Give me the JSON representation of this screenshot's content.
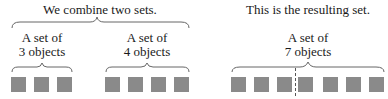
{
  "left_panel": {
    "title": "We combine two sets.",
    "set_a": {
      "line1": "A set of",
      "line2": "3 objects",
      "count": 3
    },
    "set_b": {
      "line1": "A set of",
      "line2": "4 objects",
      "count": 4
    }
  },
  "right_panel": {
    "title": "This is the resulting set.",
    "result": {
      "line1": "A set of",
      "line2": "7 objects",
      "count": 7
    }
  },
  "colors": {
    "square": "#8a8a8a",
    "brace": "#666666",
    "text": "#1a1a1a"
  }
}
